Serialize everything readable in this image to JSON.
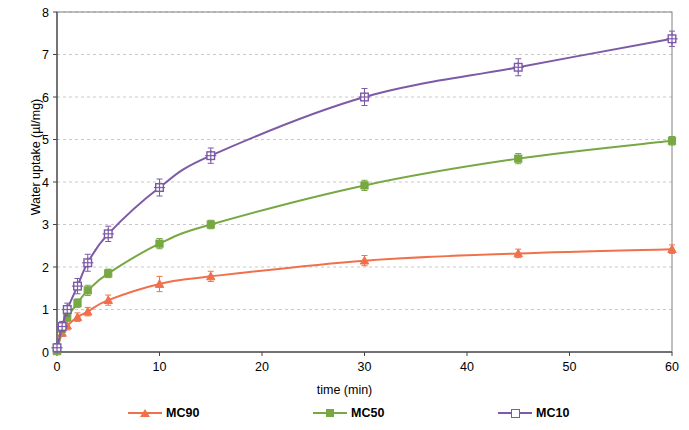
{
  "chart_data": {
    "type": "line",
    "title": "",
    "xlabel": "time (min)",
    "ylabel": "Water uptake (µl/mg)",
    "xlim": [
      0,
      60
    ],
    "ylim": [
      0,
      8
    ],
    "xticks": [
      0,
      10,
      20,
      30,
      40,
      50,
      60
    ],
    "yticks": [
      0,
      1,
      2,
      3,
      4,
      5,
      6,
      7,
      8
    ],
    "grid": true,
    "grid_axis": "y",
    "legend_position": "bottom",
    "error_bars": true,
    "x": [
      0,
      0.5,
      1,
      2,
      3,
      5,
      10,
      15,
      30,
      45,
      60
    ],
    "series": [
      {
        "name": "MC90",
        "color": "#F1704B",
        "marker": "triangle",
        "values": [
          0.05,
          0.45,
          0.62,
          0.82,
          0.95,
          1.22,
          1.6,
          1.78,
          2.15,
          2.32,
          2.42
        ],
        "errors": [
          0.05,
          0.08,
          0.1,
          0.1,
          0.1,
          0.12,
          0.18,
          0.12,
          0.12,
          0.1,
          0.1
        ]
      },
      {
        "name": "MC50",
        "color": "#77A843",
        "marker": "square",
        "values": [
          0.02,
          0.55,
          0.82,
          1.15,
          1.45,
          1.85,
          2.55,
          3.0,
          3.92,
          4.55,
          4.97
        ],
        "errors": [
          0.05,
          0.08,
          0.08,
          0.1,
          0.12,
          0.1,
          0.12,
          0.1,
          0.12,
          0.12,
          0.1
        ]
      },
      {
        "name": "MC10",
        "color": "#7C5AA6",
        "marker": "plus-square",
        "values": [
          0.1,
          0.6,
          1.0,
          1.55,
          2.1,
          2.78,
          3.87,
          4.62,
          6.0,
          6.7,
          7.37
        ],
        "errors": [
          0.1,
          0.12,
          0.15,
          0.18,
          0.2,
          0.18,
          0.2,
          0.18,
          0.2,
          0.2,
          0.18
        ]
      }
    ]
  },
  "axes": {
    "y_title": "Water uptake (µl/mg)",
    "x_title": "time (min)",
    "y_tick_labels": [
      "8",
      "7",
      "6",
      "5",
      "4",
      "3",
      "2",
      "1",
      "0"
    ],
    "x_tick_labels": [
      "0",
      "10",
      "20",
      "30",
      "40",
      "50",
      "60"
    ]
  },
  "legend": {
    "items": [
      {
        "label": "MC90",
        "color": "#F1704B"
      },
      {
        "label": "MC50",
        "color": "#77A843"
      },
      {
        "label": "MC10",
        "color": "#7C5AA6"
      }
    ]
  }
}
